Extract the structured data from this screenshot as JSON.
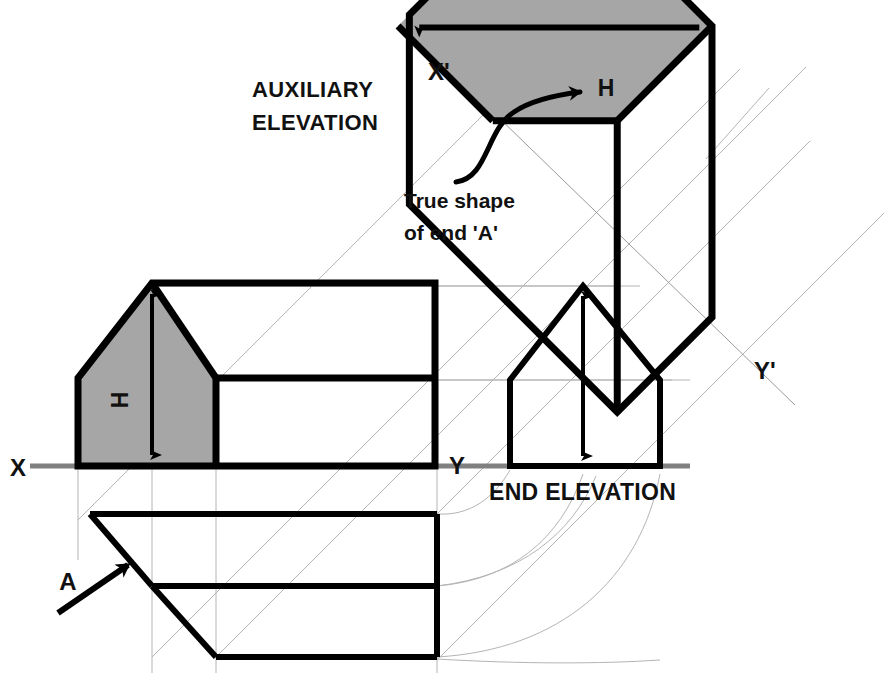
{
  "drawing": {
    "title_block": {
      "auxiliary_label_line1": "AUXILIARY",
      "auxiliary_label_line2": "ELEVATION",
      "end_elevation_label": "END ELEVATION"
    },
    "annotations": {
      "true_shape_line1": "True shape",
      "true_shape_line2": "of end 'A'",
      "height_front": "H",
      "height_auxiliary": "H",
      "direction_arrow": "A"
    },
    "axes": {
      "x": "X",
      "y": "Y",
      "x_prime": "X'",
      "y_prime": "Y'"
    },
    "colors": {
      "outline": "#000000",
      "shading": "#a6a6a6",
      "ground_line": "#808080",
      "projector": "#b4b4b4",
      "background": "#ffffff"
    },
    "geometry": {
      "ground_line_y": 466,
      "front_elevation": {
        "ridge_x": 152,
        "ridge_y": 283,
        "eaves_y": 378,
        "left_wall_x": 78,
        "gable_right_x": 216,
        "right_wall_x": 435,
        "base_y": 466
      },
      "end_elevation": {
        "apex_x": 583,
        "apex_y": 286,
        "eaves_y": 380,
        "left_x": 510,
        "right_x": 660,
        "base_y": 466
      },
      "plan": {
        "top_y": 514,
        "mid_y": 586,
        "bottom_y": 657,
        "left_x": 90,
        "hip_x": 152,
        "apex_x": 216,
        "right_x": 437
      },
      "auxiliary": {
        "rotation_deg": -45,
        "apex_x": 712,
        "apex_y": 26
      }
    }
  }
}
